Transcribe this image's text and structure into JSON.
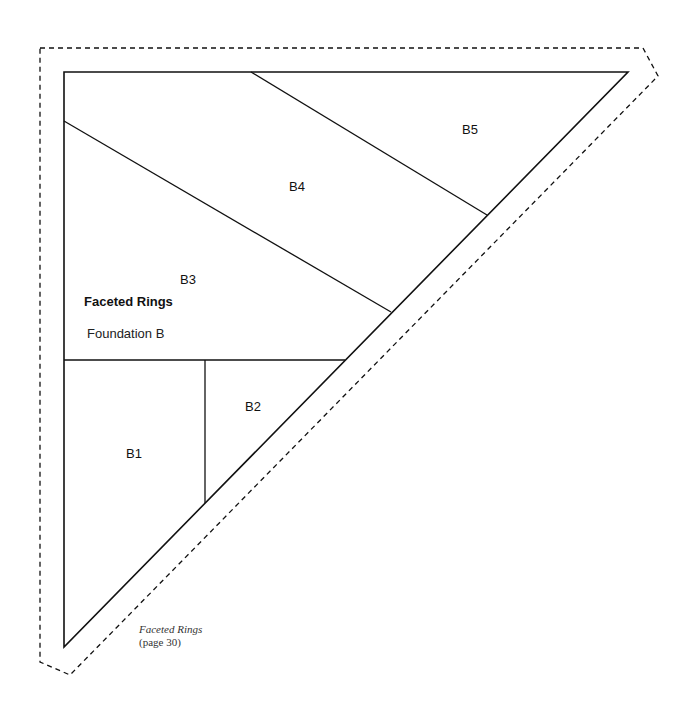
{
  "pattern": {
    "title": "Faceted Rings",
    "subtitle": "Foundation B",
    "pieces": [
      {
        "id": "B1",
        "label": "B1"
      },
      {
        "id": "B2",
        "label": "B2"
      },
      {
        "id": "B3",
        "label": "B3"
      },
      {
        "id": "B4",
        "label": "B4"
      },
      {
        "id": "B5",
        "label": "B5"
      }
    ],
    "colors": {
      "line": "#111111",
      "background": "#ffffff"
    }
  },
  "caption": {
    "title": "Faceted Rings",
    "page_ref": "(page 30)"
  }
}
